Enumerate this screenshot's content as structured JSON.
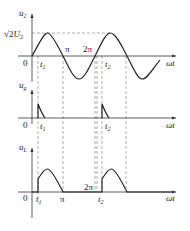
{
  "diagram": {
    "type": "half-wave controlled rectifier waveforms",
    "colors": {
      "curve": "#222222",
      "axis": "#333333",
      "dashed": "#666666"
    },
    "plots": [
      {
        "id": "u2",
        "y_label": "u",
        "y_label_sub": "2",
        "x_label": "ωt",
        "peak_label_prefix": "√2",
        "peak_label_var": "U",
        "peak_label_sub": "2",
        "origin_label": "0",
        "ticks": {
          "t1": "t",
          "t1_sub": "1",
          "pi": "π",
          "two_pi": "2π",
          "t2": "t",
          "t2_sub": "2"
        }
      },
      {
        "id": "ug",
        "y_label": "u",
        "y_label_sub": "g",
        "x_label": "ωt",
        "origin_label": "0",
        "ticks": {
          "t1": "t",
          "t1_sub": "1",
          "t2": "t",
          "t2_sub": "2"
        }
      },
      {
        "id": "uL",
        "y_label": "u",
        "y_label_sub": "L",
        "x_label": "ωt",
        "origin_label": "0",
        "ticks": {
          "t1": "t",
          "t1_sub": "1",
          "pi": "π",
          "two_pi": "2π",
          "t2": "t",
          "t2_sub": "2"
        }
      }
    ]
  }
}
